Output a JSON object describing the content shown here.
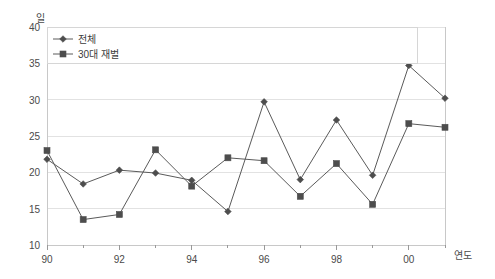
{
  "chart_data": {
    "type": "line",
    "title": "",
    "xlabel": "연도",
    "ylabel": "일",
    "x": [
      "90",
      "91",
      "92",
      "93",
      "94",
      "95",
      "96",
      "97",
      "98",
      "99",
      "00",
      "01"
    ],
    "xtick_labels": [
      "90",
      "",
      "92",
      "",
      "94",
      "",
      "96",
      "",
      "98",
      "",
      "00",
      ""
    ],
    "xlim": [
      0,
      11
    ],
    "ylim": [
      10,
      40
    ],
    "ytick_labels": [
      "10",
      "15",
      "20",
      "25",
      "30",
      "35",
      "40"
    ],
    "yticks": [
      10,
      15,
      20,
      25,
      30,
      35,
      40
    ],
    "grid": true,
    "legend_position": "top-left",
    "series": [
      {
        "name": "전체",
        "marker": "diamond",
        "values": [
          21.8,
          18.4,
          20.3,
          19.9,
          18.9,
          14.6,
          29.7,
          19.0,
          27.2,
          19.6,
          34.7,
          30.2
        ]
      },
      {
        "name": "30대 재벌",
        "marker": "square",
        "values": [
          23.0,
          13.5,
          14.2,
          23.1,
          18.1,
          22.0,
          21.6,
          16.7,
          21.2,
          15.6,
          26.7,
          26.2
        ]
      }
    ]
  },
  "axes": {
    "y_unit_label": "일",
    "x_unit_label": "연도"
  },
  "legend": {
    "entries": [
      {
        "label": "전체"
      },
      {
        "label": "30대 재벌"
      }
    ]
  },
  "colors": {
    "line": "#5a5a5a",
    "marker": "#4d4d4d",
    "grid": "#e2e2e2",
    "axis": "#c8c8c8",
    "text": "#4a4a4a",
    "background": "#ffffff"
  }
}
